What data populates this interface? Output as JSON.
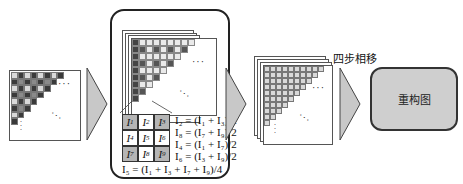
{
  "diagram": {
    "stage1": {
      "name": "input-checker-pattern-image",
      "ellipsis_h": "···",
      "ellipsis_d": "···",
      "ellipsis_v": "⋮"
    },
    "stage2": {
      "name": "interpolation-panel",
      "grid_labels": [
        "I1",
        "I2",
        "I3",
        "I4",
        "I5",
        "I6",
        "I7",
        "I8",
        "I9"
      ],
      "formulas": [
        "I₂ = (I₁ + I₃)/2",
        "I₈ = (I₇ + I₉)/2",
        "I₄ = (I₁ + I₇)/2",
        "I₆ = (I₃ + I₉)/2"
      ],
      "bottom_formula": "I₅ = (I₁ + I₃ + I₇ + I₉)/4"
    },
    "stage3": {
      "name": "interpolated-image-stack"
    },
    "step_label": "四步相移",
    "result_label": "重构图",
    "colors": {
      "dark_cell": "#3a3a3a",
      "mid_cell": "#8a8a8a",
      "light_cell": "#d9d9d9",
      "arrow_fill": "#c8c8c8",
      "result_fill": "#cfcfcf",
      "grid_gray": "#b5b5b5"
    }
  }
}
